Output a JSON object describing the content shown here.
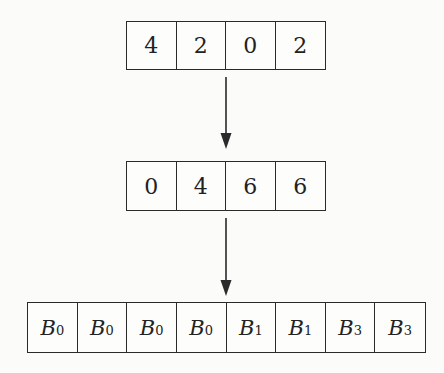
{
  "diagram": {
    "rows": [
      {
        "name": "input-counts",
        "cells": [
          "4",
          "2",
          "0",
          "2"
        ]
      },
      {
        "name": "prefix-sums",
        "cells": [
          "0",
          "4",
          "6",
          "6"
        ]
      },
      {
        "name": "output-buckets",
        "cells": [
          {
            "base": "B",
            "sub": "0"
          },
          {
            "base": "B",
            "sub": "0"
          },
          {
            "base": "B",
            "sub": "0"
          },
          {
            "base": "B",
            "sub": "0"
          },
          {
            "base": "B",
            "sub": "1"
          },
          {
            "base": "B",
            "sub": "1"
          },
          {
            "base": "B",
            "sub": "3"
          },
          {
            "base": "B",
            "sub": "3"
          }
        ]
      }
    ],
    "arrows": [
      {
        "from": "input-counts",
        "to": "prefix-sums",
        "direction": "down"
      },
      {
        "from": "prefix-sums",
        "to": "output-buckets",
        "direction": "down"
      }
    ],
    "colors": {
      "line": "#2a2a2a",
      "background": "#fbfbfa"
    }
  }
}
